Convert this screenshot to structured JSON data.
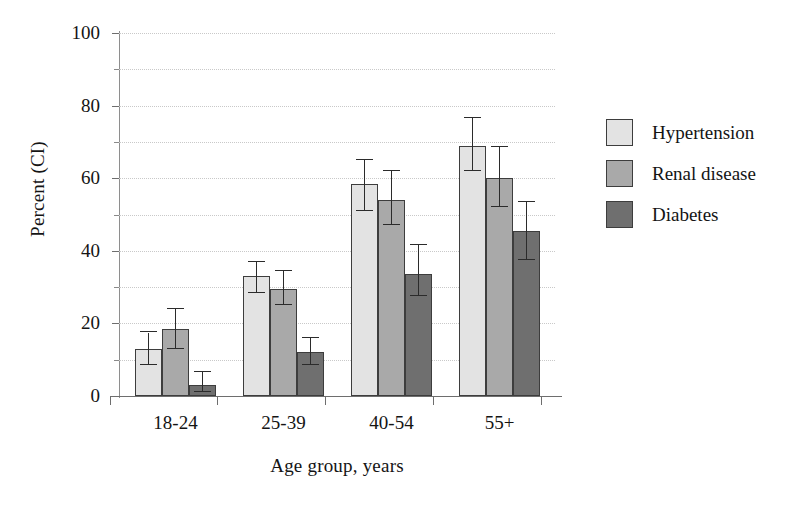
{
  "chart_data": {
    "type": "bar",
    "title": "",
    "subtitle": "",
    "xlabel": "Age group, years",
    "ylabel": "Percent (CI)",
    "categories": [
      "18-24",
      "25-39",
      "40-54",
      "55+"
    ],
    "ylim": [
      0,
      100
    ],
    "y_major_ticks": [
      0,
      20,
      40,
      60,
      80,
      100
    ],
    "y_minor_ticks": [
      10,
      30,
      50,
      70,
      90
    ],
    "y_tick_labels": [
      "0",
      "20",
      "40",
      "60",
      "80",
      "100"
    ],
    "grid": "horizontal-dotted",
    "legend_position": "right",
    "error_bars": "CI",
    "series": [
      {
        "name": "Hypertension",
        "color": "#e3e3e3",
        "values": [
          13,
          33,
          58.5,
          69
        ],
        "ci_low": [
          8.5,
          28.5,
          51,
          62
        ],
        "ci_high": [
          17.5,
          37,
          65,
          76.5
        ]
      },
      {
        "name": "Renal disease",
        "color": "#a9a9a9",
        "values": [
          18.5,
          29.5,
          54,
          60
        ],
        "ci_low": [
          13,
          25,
          47,
          52
        ],
        "ci_high": [
          24,
          34.5,
          62,
          68.5
        ]
      },
      {
        "name": "Diabetes",
        "color": "#6f6f6f",
        "values": [
          3,
          12,
          33.5,
          45.5
        ],
        "ci_low": [
          1,
          8.5,
          27.5,
          37.5
        ],
        "ci_high": [
          6.5,
          16,
          41.5,
          53.5
        ]
      }
    ]
  },
  "legend": {
    "items": [
      {
        "label": "Hypertension"
      },
      {
        "label": "Renal disease"
      },
      {
        "label": "Diabetes"
      }
    ]
  },
  "axes": {
    "x_title": "Age group, years",
    "y_title": "Percent (CI)"
  }
}
